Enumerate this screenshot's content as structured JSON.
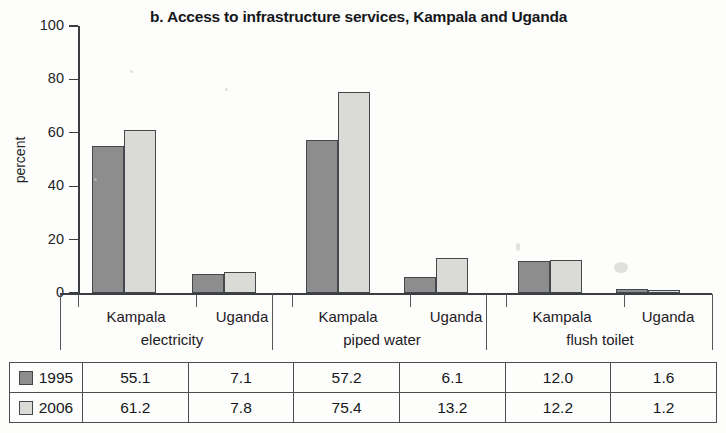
{
  "chart_data": {
    "type": "bar",
    "title": "b. Access to infrastructure services, Kampala and Uganda",
    "xlabel": "",
    "ylabel": "percent",
    "ylim": [
      0,
      100
    ],
    "yticks": [
      0,
      20,
      40,
      60,
      80,
      100
    ],
    "grid": false,
    "legend_position": "table-below",
    "categories": [
      "electricity - Kampala",
      "electricity - Uganda",
      "piped water - Kampala",
      "piped water - Uganda",
      "flush toilet - Kampala",
      "flush toilet - Uganda"
    ],
    "groups": [
      {
        "name": "electricity",
        "subcategories": [
          "Kampala",
          "Uganda"
        ]
      },
      {
        "name": "piped water",
        "subcategories": [
          "Kampala",
          "Uganda"
        ]
      },
      {
        "name": "flush toilet",
        "subcategories": [
          "Kampala",
          "Uganda"
        ]
      }
    ],
    "series": [
      {
        "name": "1995",
        "color": "#8d8d8d",
        "values": [
          55.1,
          7.1,
          57.2,
          6.1,
          12.0,
          1.6
        ]
      },
      {
        "name": "2006",
        "color": "#dadbd7",
        "values": [
          61.2,
          7.8,
          75.4,
          13.2,
          12.2,
          1.2
        ]
      }
    ]
  },
  "axis": {
    "y_label": "percent",
    "y_tick_labels": [
      "100",
      "80",
      "60",
      "40",
      "20",
      "0"
    ],
    "x_city_labels": [
      "Kampala",
      "Uganda",
      "Kampala",
      "Uganda",
      "Kampala",
      "Uganda"
    ],
    "x_group_labels": [
      "electricity",
      "piped water",
      "flush toilet"
    ]
  },
  "table": {
    "rows": [
      {
        "year": "1995",
        "swatch": "dark-gray",
        "values": [
          "55.1",
          "7.1",
          "57.2",
          "6.1",
          "12.0",
          "1.6"
        ]
      },
      {
        "year": "2006",
        "swatch": "light-gray",
        "values": [
          "61.2",
          "7.8",
          "75.4",
          "13.2",
          "12.2",
          "1.2"
        ]
      }
    ]
  },
  "colors": {
    "series_1995": "#8d8d8d",
    "series_2006": "#dadbd7",
    "axis": "#3a3d42",
    "text": "#15171a"
  }
}
